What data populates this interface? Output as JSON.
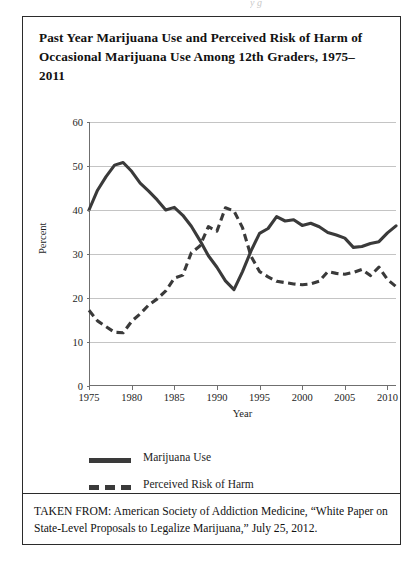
{
  "page": {
    "top_sliver_text": "y  g"
  },
  "figure": {
    "title": "Past Year Marijuana Use and Perceived Risk of Harm of Occasional Marijuana Use Among 12th Graders, 1975–2011",
    "source_caption": "TAKEN FROM: American Society of Addiction Medicine, “White Paper on State-Level Proposals to Legalize Marijuana,” July 25, 2012."
  },
  "legend": {
    "position": "below-plot-left",
    "items": [
      {
        "label": "Marijuana Use",
        "style": "solid",
        "color": "#3a3a3a"
      },
      {
        "label": "Perceived Risk of Harm",
        "style": "dashed",
        "color": "#3a3a3a"
      }
    ]
  },
  "chart_data": {
    "type": "line",
    "title": "Past Year Marijuana Use and Perceived Risk of Harm of Occasional Marijuana Use Among 12th Graders, 1975–2011",
    "xlabel": "Year",
    "ylabel": "Percent",
    "xlim": [
      1975,
      2011
    ],
    "ylim": [
      0,
      60
    ],
    "ytick_labels": [
      "0",
      "10",
      "20",
      "30",
      "40",
      "50",
      "60"
    ],
    "yticks": [
      0,
      10,
      20,
      30,
      40,
      50,
      60
    ],
    "xtick_labels": [
      "1975",
      "1980",
      "1985",
      "1990",
      "1995",
      "2000",
      "2005",
      "2010"
    ],
    "xticks": [
      1975,
      1980,
      1985,
      1990,
      1995,
      2000,
      2005,
      2010
    ],
    "grid": "horizontal",
    "x": [
      1975,
      1976,
      1977,
      1978,
      1979,
      1980,
      1981,
      1982,
      1983,
      1984,
      1985,
      1986,
      1987,
      1988,
      1989,
      1990,
      1991,
      1992,
      1993,
      1994,
      1995,
      1996,
      1997,
      1998,
      1999,
      2000,
      2001,
      2002,
      2003,
      2004,
      2005,
      2006,
      2007,
      2008,
      2009,
      2010,
      2011
    ],
    "series": [
      {
        "name": "Marijuana Use",
        "style": "solid",
        "color": "#3a3a3a",
        "values": [
          40.0,
          44.5,
          47.6,
          50.2,
          50.8,
          48.8,
          46.1,
          44.3,
          42.3,
          40.0,
          40.6,
          38.8,
          36.3,
          33.1,
          29.6,
          27.0,
          23.9,
          21.9,
          26.0,
          30.7,
          34.7,
          35.8,
          38.5,
          37.5,
          37.8,
          36.5,
          37.0,
          36.2,
          34.9,
          34.3,
          33.6,
          31.5,
          31.7,
          32.4,
          32.8,
          34.8,
          36.4
        ]
      },
      {
        "name": "Perceived Risk of Harm",
        "style": "dashed",
        "color": "#3a3a3a",
        "values": [
          17.2,
          14.8,
          13.5,
          12.2,
          12.1,
          14.7,
          16.4,
          18.4,
          19.8,
          21.6,
          24.5,
          25.2,
          30.3,
          31.8,
          36.2,
          35.2,
          40.5,
          39.8,
          36.0,
          29.5,
          26.0,
          24.8,
          23.8,
          23.5,
          23.2,
          23.0,
          23.2,
          23.8,
          26.0,
          25.6,
          25.4,
          25.8,
          26.5,
          25.1,
          27.0,
          24.2,
          22.6
        ]
      }
    ]
  }
}
